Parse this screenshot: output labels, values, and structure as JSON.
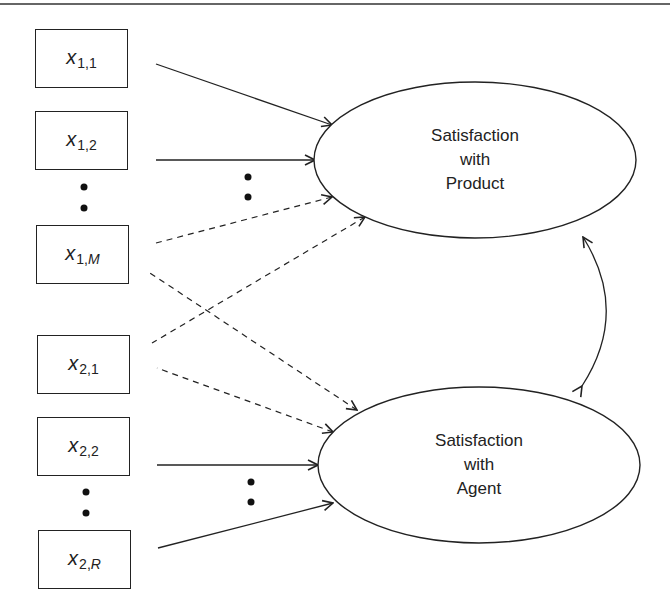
{
  "diagram": {
    "type": "structural equation model / confirmatory factor analysis path diagram",
    "colors": {
      "stroke": "#222222",
      "background": "#ffffff"
    },
    "observed": [
      {
        "id": "x11",
        "var": "x",
        "sub_main": "1,",
        "sub_index": "1",
        "index_italic": false
      },
      {
        "id": "x12",
        "var": "x",
        "sub_main": "1,",
        "sub_index": "2",
        "index_italic": false
      },
      {
        "id": "x1M",
        "var": "x",
        "sub_main": "1,",
        "sub_index": "M",
        "index_italic": true
      },
      {
        "id": "x21",
        "var": "x",
        "sub_main": "2,",
        "sub_index": "1",
        "index_italic": false
      },
      {
        "id": "x22",
        "var": "x",
        "sub_main": "2,",
        "sub_index": "2",
        "index_italic": false
      },
      {
        "id": "x2R",
        "var": "x",
        "sub_main": "2,",
        "sub_index": "R",
        "index_italic": true
      }
    ],
    "latent": [
      {
        "id": "product",
        "lines": [
          "Satisfaction",
          "with",
          "Product"
        ]
      },
      {
        "id": "agent",
        "lines": [
          "Satisfaction",
          "with",
          "Agent"
        ]
      }
    ],
    "paths": [
      {
        "from": "product",
        "to": "x11",
        "style": "solid"
      },
      {
        "from": "product",
        "to": "x12",
        "style": "solid"
      },
      {
        "from": "product",
        "to": "x1M",
        "style": "dashed"
      },
      {
        "from": "product",
        "to": "x21",
        "style": "dashed"
      },
      {
        "from": "agent",
        "to": "x1M",
        "style": "dashed"
      },
      {
        "from": "agent",
        "to": "x21",
        "style": "dashed"
      },
      {
        "from": "agent",
        "to": "x22",
        "style": "solid"
      },
      {
        "from": "agent",
        "to": "x2R",
        "style": "solid"
      },
      {
        "from": "product",
        "to": "agent",
        "style": "curved-double-headed",
        "meaning": "covariance"
      }
    ],
    "ellipsis_markers": [
      "vertical dots between x1,2 and x1,M",
      "vertical dots between x2,2 and x2,R",
      "vertical dots between product paths",
      "vertical dots between agent paths"
    ]
  }
}
